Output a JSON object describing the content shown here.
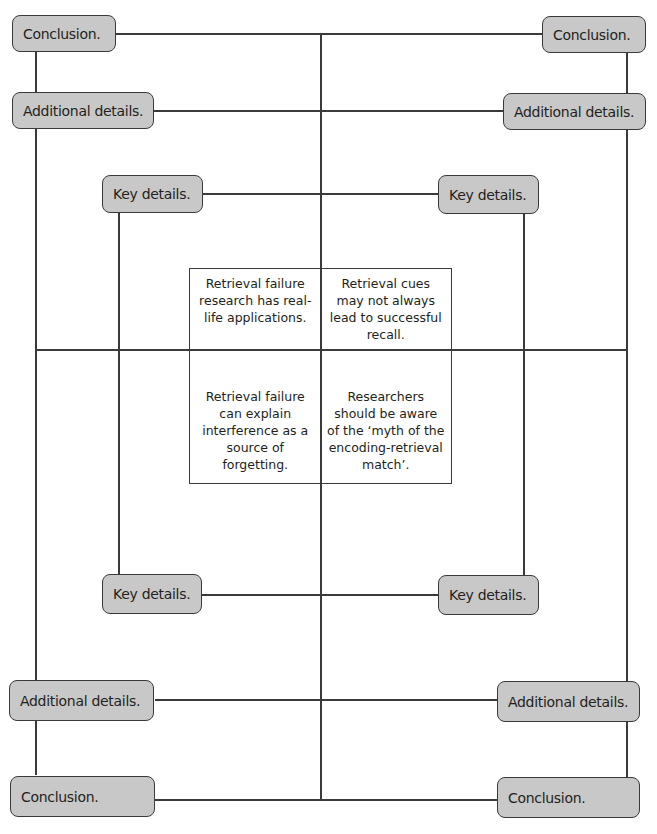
{
  "diagram": {
    "type": "structured-argument-frame",
    "nodes": {
      "top_left_conclusion": "Conclusion.",
      "top_right_conclusion": "Conclusion.",
      "top_left_additional": "Additional details.",
      "top_right_additional": "Additional details.",
      "top_left_key": "Key details.",
      "top_right_key": "Key details.",
      "bottom_left_key": "Key details.",
      "bottom_right_key": "Key details.",
      "bottom_left_additional": "Additional details.",
      "bottom_right_additional": "Additional details.",
      "bottom_left_conclusion": "Conclusion.",
      "bottom_right_conclusion": "Conclusion."
    },
    "center_grid": {
      "top_left": "Retrieval failure research has real-life applications.",
      "top_right": "Retrieval cues may not always lead to successful recall.",
      "bottom_left": "Retrieval failure can explain interference as a source of forgetting.",
      "bottom_right": "Researchers should be aware of the ‘myth of the encoding-retrieval match’."
    },
    "colors": {
      "node_fill": "#c8c8c8",
      "line": "#3a3a3a",
      "background": "#ffffff"
    }
  }
}
